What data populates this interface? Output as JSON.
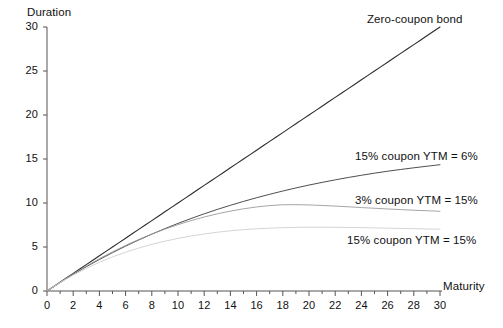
{
  "chart_data": {
    "type": "line",
    "title": "",
    "xlabel": "Maturity",
    "ylabel": "Duration",
    "xlim": [
      0,
      30
    ],
    "ylim": [
      0,
      30
    ],
    "grid": false,
    "legend_position": "inline-right",
    "xticks": [
      0,
      2,
      4,
      6,
      8,
      10,
      12,
      14,
      16,
      18,
      20,
      22,
      24,
      26,
      28,
      30
    ],
    "xtick_labels": [
      "0",
      "2",
      "4",
      "6",
      "8",
      "10",
      "12",
      "14",
      "16",
      "18",
      "20",
      "22",
      "24",
      "26",
      "28",
      "30"
    ],
    "xminor_ticks": [
      1,
      3,
      5,
      7,
      9,
      11,
      13,
      15,
      17,
      19,
      21,
      23,
      25,
      27,
      29
    ],
    "yticks": [
      0,
      5,
      10,
      15,
      20,
      25,
      30
    ],
    "ytick_labels": [
      "0",
      "5",
      "10",
      "15",
      "20",
      "25",
      "30"
    ],
    "x": [
      0,
      1,
      2,
      3,
      4,
      5,
      6,
      7,
      8,
      9,
      10,
      11,
      12,
      13,
      14,
      15,
      16,
      17,
      18,
      19,
      20,
      21,
      22,
      23,
      24,
      25,
      26,
      27,
      28,
      29,
      30
    ],
    "series": [
      {
        "name": "Zero-coupon bond",
        "color": "#2b2b2b",
        "width": 1.1,
        "label_x": 30,
        "label_y": 30,
        "values": [
          0,
          1,
          2,
          3,
          4,
          5,
          6,
          7,
          8,
          9,
          10,
          11,
          12,
          13,
          14,
          15,
          16,
          17,
          18,
          19,
          20,
          21,
          22,
          23,
          24,
          25,
          26,
          27,
          28,
          29,
          30
        ]
      },
      {
        "name": "15% coupon YTM = 6%",
        "color": "#3a3a3a",
        "width": 0.9,
        "label_x": 30,
        "label_y": 13.2,
        "values": [
          0,
          0.97,
          1.89,
          2.76,
          3.58,
          4.36,
          5.1,
          5.8,
          6.46,
          7.09,
          7.68,
          8.24,
          8.77,
          9.27,
          9.74,
          10.18,
          10.6,
          10.99,
          11.36,
          11.71,
          12.04,
          12.34,
          12.63,
          12.9,
          13.15,
          13.39,
          13.61,
          13.81,
          14.0,
          14.18,
          14.35
        ]
      },
      {
        "name": "3% coupon YTM = 15%",
        "color": "#9b9b9b",
        "width": 0.9,
        "label_x": 30,
        "label_y": 9.1,
        "values": [
          0,
          0.99,
          1.94,
          2.83,
          3.67,
          4.45,
          5.18,
          5.85,
          6.47,
          7.03,
          7.54,
          8.0,
          8.41,
          8.77,
          9.08,
          9.34,
          9.55,
          9.71,
          9.8,
          9.81,
          9.78,
          9.72,
          9.65,
          9.57,
          9.48,
          9.4,
          9.32,
          9.25,
          9.18,
          9.12,
          9.06
        ]
      },
      {
        "name": "15% coupon YTM = 15%",
        "color": "#cfcfcf",
        "width": 0.9,
        "label_x": 30,
        "label_y": 7.0,
        "values": [
          0,
          0.95,
          1.8,
          2.57,
          3.26,
          3.87,
          4.41,
          4.88,
          5.3,
          5.66,
          5.98,
          6.25,
          6.48,
          6.68,
          6.84,
          6.97,
          7.07,
          7.14,
          7.2,
          7.23,
          7.25,
          7.25,
          7.24,
          7.22,
          7.2,
          7.17,
          7.14,
          7.11,
          7.08,
          7.05,
          7.02
        ]
      }
    ]
  },
  "axes": {
    "y_axis_title": "Duration",
    "x_axis_title": "Maturity"
  },
  "series_labels": {
    "zero_coupon": "Zero-coupon bond",
    "coupon15_ytm6": "15% coupon YTM = 6%",
    "coupon3_ytm15": "3% coupon YTM = 15%",
    "coupon15_ytm15": "15% coupon YTM = 15%"
  },
  "colors": {
    "axis": "#555555",
    "text": "#111111",
    "zero_coupon": "#2b2b2b",
    "coupon15_ytm6": "#3a3a3a",
    "coupon3_ytm15": "#9b9b9b",
    "coupon15_ytm15": "#cfcfcf",
    "background": "#ffffff"
  }
}
